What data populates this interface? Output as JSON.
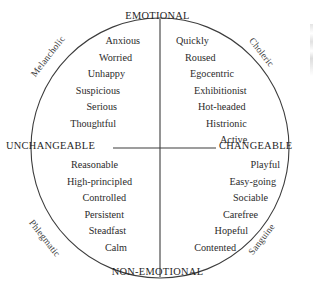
{
  "diagram": {
    "axes": {
      "top_label": "EMOTIONAL",
      "bottom_label": "NON-EMOTIONAL",
      "left_label": "UNCHANGEABLE",
      "right_label": "CHANGEABLE"
    },
    "temperaments": {
      "upper_left": "Melancholic",
      "upper_right": "Choleric",
      "lower_left": "Phlegmatic",
      "lower_right": "Sanguine"
    },
    "quadrants": {
      "melancholic": {
        "name": "Melancholic",
        "traits": [
          "Anxious",
          "Worried",
          "Unhappy",
          "Suspicious",
          "Serious",
          "Thoughtful"
        ]
      },
      "choleric": {
        "name": "Choleric",
        "traits": [
          "Quickly",
          "Roused",
          "Egocentric",
          "Exhibitionist",
          "Hot-headed",
          "Histrionic",
          "Active"
        ]
      },
      "phlegmatic": {
        "name": "Phlegmatic",
        "traits": [
          "Reasonable",
          "High-principled",
          "Controlled",
          "Persistent",
          "Steadfast",
          "Calm"
        ]
      },
      "sanguine": {
        "name": "Sanguine",
        "traits": [
          "Playful",
          "Easy-going",
          "Sociable",
          "Carefree",
          "Hopeful",
          "Contented"
        ]
      }
    },
    "colors": {
      "background": "#ffffff",
      "stroke": "#3c3c3c",
      "text": "#2b2b2b"
    }
  }
}
